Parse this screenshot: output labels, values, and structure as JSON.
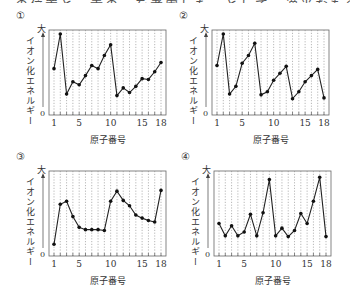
{
  "header": {
    "cutoff_text": "…の位置と元素の…を考慮した…として…適当なもの…"
  },
  "common": {
    "ylabel": "イオン化エネルギー",
    "ymax_label": "大",
    "yzero_label": "0",
    "xlabel": "原子番号",
    "xticks": [
      1,
      5,
      10,
      15,
      18
    ]
  },
  "panels": [
    {
      "label": "①"
    },
    {
      "label": "②"
    },
    {
      "label": "③"
    },
    {
      "label": "④"
    }
  ],
  "chart_data": [
    {
      "type": "line",
      "title": "①",
      "xlabel": "原子番号",
      "ylabel": "イオン化エネルギー",
      "x": [
        1,
        2,
        3,
        4,
        5,
        6,
        7,
        8,
        9,
        10,
        11,
        12,
        13,
        14,
        15,
        16,
        17,
        18
      ],
      "values": [
        0.55,
        1.0,
        0.22,
        0.38,
        0.34,
        0.46,
        0.59,
        0.55,
        0.72,
        0.86,
        0.2,
        0.3,
        0.24,
        0.32,
        0.42,
        0.41,
        0.51,
        0.63
      ],
      "ylim": [
        0,
        1
      ],
      "ytick_labels": [
        "0",
        "大"
      ],
      "xtick_labels": [
        "1",
        "5",
        "10",
        "15",
        "18"
      ],
      "grid": "vertical dotted"
    },
    {
      "type": "line",
      "title": "②",
      "xlabel": "原子番号",
      "ylabel": "イオン化エネルギー",
      "x": [
        1,
        2,
        3,
        4,
        5,
        6,
        7,
        8,
        9,
        10,
        11,
        12,
        13,
        14,
        15,
        16,
        17,
        18
      ],
      "values": [
        0.59,
        1.0,
        0.22,
        0.32,
        0.62,
        0.72,
        0.88,
        0.21,
        0.25,
        0.4,
        0.49,
        0.58,
        0.16,
        0.25,
        0.38,
        0.46,
        0.54,
        0.17
      ],
      "ylim": [
        0,
        1
      ],
      "ytick_labels": [
        "0",
        "大"
      ],
      "xtick_labels": [
        "1",
        "5",
        "10",
        "15",
        "18"
      ],
      "grid": "vertical dotted"
    },
    {
      "type": "line",
      "title": "③",
      "xlabel": "原子番号",
      "ylabel": "イオン化エネルギー",
      "x": [
        1,
        2,
        3,
        4,
        5,
        6,
        7,
        8,
        9,
        10,
        11,
        12,
        13,
        14,
        15,
        16,
        17,
        18
      ],
      "values": [
        0.1,
        0.62,
        0.66,
        0.46,
        0.32,
        0.29,
        0.29,
        0.29,
        0.28,
        0.66,
        0.79,
        0.67,
        0.6,
        0.48,
        0.44,
        0.41,
        0.39,
        0.8
      ],
      "ylim": [
        0,
        1
      ],
      "ytick_labels": [
        "0",
        "大"
      ],
      "xtick_labels": [
        "1",
        "5",
        "10",
        "15",
        "18"
      ],
      "grid": "vertical dotted"
    },
    {
      "type": "line",
      "title": "④",
      "xlabel": "原子番号",
      "ylabel": "イオン化エネルギー",
      "x": [
        1,
        2,
        3,
        4,
        5,
        6,
        7,
        8,
        9,
        10,
        11,
        12,
        13,
        14,
        15,
        16,
        17,
        18
      ],
      "values": [
        0.37,
        0.21,
        0.34,
        0.21,
        0.26,
        0.49,
        0.21,
        0.51,
        0.94,
        0.21,
        0.31,
        0.2,
        0.28,
        0.5,
        0.37,
        0.66,
        0.97,
        0.2
      ],
      "ylim": [
        0,
        1
      ],
      "ytick_labels": [
        "0",
        "大"
      ],
      "xtick_labels": [
        "1",
        "5",
        "10",
        "15",
        "18"
      ],
      "grid": "vertical dotted"
    }
  ]
}
